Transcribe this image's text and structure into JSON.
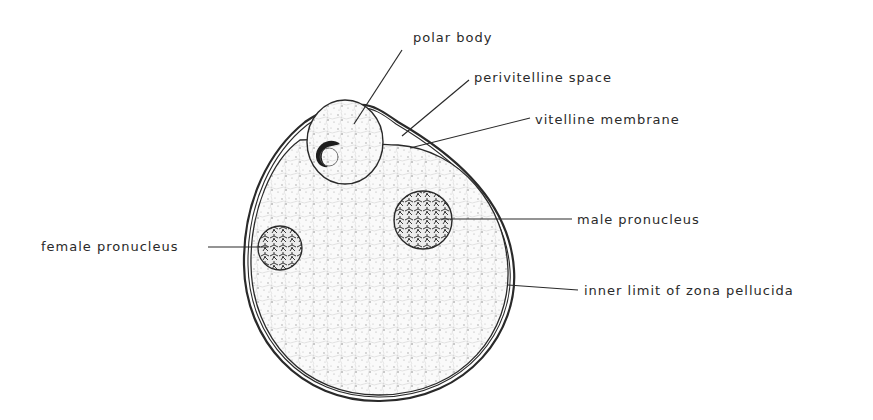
{
  "diagram": {
    "ink_color": "#2a2a2a",
    "stipple_color": "#8a8a8a",
    "labels": {
      "polar_body": "polar body",
      "perivitelline_space": "perivitelline space",
      "vitelline_membrane": "vitelline membrane",
      "male_pronucleus": "male pronucleus",
      "female_pronucleus": "female pronucleus",
      "zona_pellucida": "inner limit of zona pellucida"
    }
  }
}
